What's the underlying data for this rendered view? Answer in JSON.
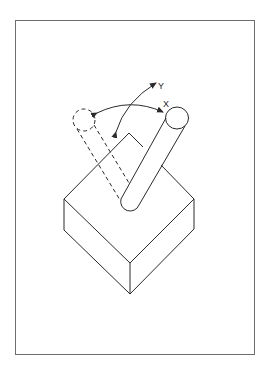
{
  "diagram": {
    "title": "",
    "labels": {
      "x_axis": "X",
      "y_axis": "Y"
    },
    "elements": {
      "frame": "border-frame",
      "block": "isometric-block",
      "rod_solid": "rod-current-position",
      "rod_dashed": "rod-alternate-position",
      "arrow_x": "x-rotation-arrow",
      "arrow_y": "y-rotation-arrow"
    },
    "colors": {
      "line": "#2a2a2a",
      "frame": "#6e6e6e",
      "background": "#ffffff"
    }
  }
}
